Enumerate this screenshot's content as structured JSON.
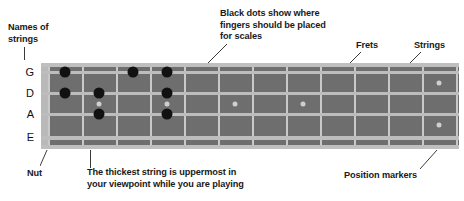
{
  "annotations": {
    "names_of_strings": "Names of\nstrings",
    "black_dots": "Black dots show where\nfingers should be placed\nfor scales",
    "frets": "Frets",
    "strings": "Strings",
    "nut": "Nut",
    "thickest_string": "The thickest string is uppermost in\nyour viewpoint while you are playing",
    "position_markers": "Position markers"
  },
  "string_names": [
    "G",
    "D",
    "A",
    "E"
  ],
  "colors": {
    "fretboard": "#6e6e6e",
    "fret_wire": "#c9c9c9",
    "string_line": "#bdbdbd",
    "nut": "#b9b9b9",
    "finger_dot": "#111111",
    "position_marker": "#cfcfcf",
    "text": "#1a1a1a",
    "leader_line": "#3b3b3b",
    "background": "#ffffff"
  },
  "fretboard": {
    "fret_count": 12,
    "string_count": 4,
    "finger_dots": [
      {
        "string": "G",
        "fret": 2
      },
      {
        "string": "G",
        "fret": 4
      },
      {
        "string": "G",
        "fret": 5
      },
      {
        "string": "D",
        "fret": 2
      },
      {
        "string": "D",
        "fret": 3
      },
      {
        "string": "D",
        "fret": 5
      },
      {
        "string": "A",
        "fret": 3
      },
      {
        "string": "A",
        "fret": 5
      }
    ],
    "position_markers": [
      {
        "fret": 3
      },
      {
        "fret": 5
      },
      {
        "fret": 7
      },
      {
        "fret": 9
      },
      {
        "fret": 12
      }
    ]
  }
}
